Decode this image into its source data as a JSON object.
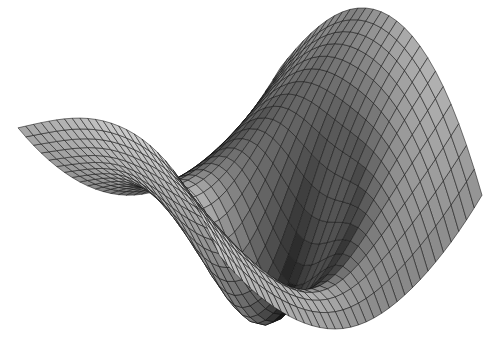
{
  "figure": {
    "title": "",
    "background_color": "#ffffff",
    "width": 500,
    "height": 337,
    "render_style": "shaded-wireframe-mesh",
    "colormap": "grayscale",
    "colormap_low": "#1a1a1a",
    "colormap_high": "#f2f2f2",
    "mesh_line_color": "#141414",
    "mesh_line_width": 0.55,
    "axes_visible": false,
    "ticks_visible": false,
    "labels_visible": false,
    "legend_visible": false,
    "grid_visible": false
  },
  "chart_data": {
    "type": "surface",
    "title": "",
    "subtitle": "",
    "xlabel": "",
    "ylabel": "",
    "zlabel": "",
    "xlim": [
      -1,
      1
    ],
    "ylim": [
      -1,
      1
    ],
    "zlim": [
      -1.25,
      1.25
    ],
    "grid": false,
    "legend": "none",
    "colorbar": false,
    "shading": "faceted",
    "face_color_mode": "height-mapped-grayscale",
    "edge_color": "#141414",
    "nu": 34,
    "nv": 26,
    "view": {
      "azimuth": -37.5,
      "elevation": 24,
      "roll": 0
    },
    "features": [
      {
        "name": "upper-left-wing",
        "pixel_anchor": [
          150,
          70
        ],
        "relative_height": 0.85,
        "shade": "dark"
      },
      {
        "name": "top-spike",
        "pixel_anchor": [
          207,
          8
        ],
        "relative_height": 1.0,
        "shade": "very-dark"
      },
      {
        "name": "notch-between-wings",
        "pixel_anchor": [
          285,
          55
        ],
        "relative_height": 0.15,
        "shade": "background"
      },
      {
        "name": "upper-right-wing",
        "pixel_anchor": [
          400,
          75
        ],
        "relative_height": 0.8,
        "shade": "mid"
      },
      {
        "name": "central-valley",
        "pixel_anchor": [
          290,
          160
        ],
        "relative_height": -0.95,
        "shade": "very-dark"
      },
      {
        "name": "left-lobe-tip",
        "pixel_anchor": [
          22,
          178
        ],
        "relative_height": 0.05,
        "shade": "mid"
      },
      {
        "name": "bright-band",
        "pixel_anchor": [
          170,
          230
        ],
        "relative_height": 0.35,
        "shade": "light"
      },
      {
        "name": "lower-lobe-tip",
        "pixel_anchor": [
          347,
          312
        ],
        "relative_height": -0.55,
        "shade": "mid"
      },
      {
        "name": "right-lobe-tip",
        "pixel_anchor": [
          484,
          150
        ],
        "relative_height": 0.1,
        "shade": "mid"
      }
    ],
    "u_lines": 34,
    "v_lines": 26,
    "gray_levels": [
      0.08,
      0.16,
      0.24,
      0.32,
      0.4,
      0.48,
      0.56,
      0.64,
      0.72,
      0.8,
      0.88,
      0.95
    ]
  },
  "accessibility": {
    "alt_text": "Grayscale three dimensional shaded wireframe surface plot of a folded saddle shape on a white background"
  }
}
